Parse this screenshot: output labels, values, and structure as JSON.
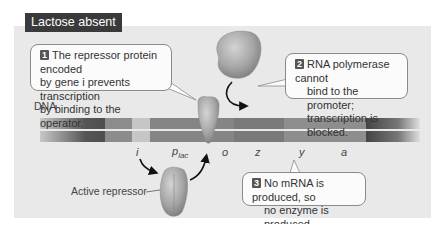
{
  "title": "Lactose absent",
  "callouts": [
    {
      "number": "1",
      "lines": [
        "The repressor protein encoded",
        "by gene i prevents transcription",
        "by binding to the operator."
      ]
    },
    {
      "number": "2",
      "lines": [
        "RNA polymerase cannot",
        "bind to the promoter;",
        "transcription is blocked."
      ]
    },
    {
      "number": "3",
      "lines": [
        "No mRNA is produced, so",
        "no enzyme is produced."
      ]
    }
  ],
  "labels": {
    "dna": "DNA",
    "active_repressor": "Active repressor"
  },
  "genes": {
    "i": "i",
    "p": "p",
    "p_sub": "lac",
    "o": "o",
    "z": "z",
    "y": "y",
    "a": "a"
  },
  "colors": {
    "panel_bg": "#e9e9e9",
    "title_bg": "#3a3a3a",
    "dna_dark": "#5a5a5a",
    "dna_mid": "#8a8a8a",
    "dna_light": "#c4c4c4",
    "protein": "#a8a8a8"
  }
}
